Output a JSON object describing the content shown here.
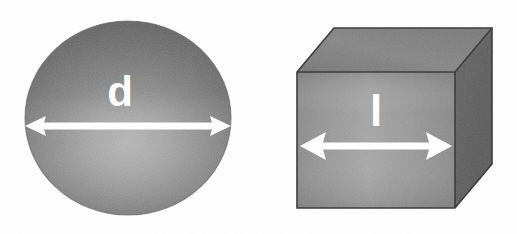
{
  "figure": {
    "background_color": "#ffffff",
    "width": 517,
    "height": 234,
    "texture": "film-grain-noise"
  },
  "sphere": {
    "shape_name": "sphere",
    "label": "d",
    "label_meaning": "diameter",
    "dimension_arrow": {
      "orientation": "horizontal",
      "heads": "double",
      "color": "#ffffff",
      "spans": "full-diameter"
    },
    "geometry": {
      "center_x": 128,
      "center_y": 118,
      "radius_x": 103,
      "radius_y": 97
    },
    "colors": {
      "edge": "#676767",
      "mid": "#888888",
      "highlight": "#aeaeae"
    }
  },
  "cube": {
    "shape_name": "cube",
    "label": "l",
    "label_meaning": "side length",
    "dimension_arrow": {
      "orientation": "horizontal",
      "heads": "double",
      "color": "#ffffff",
      "spans": "front-face-width"
    },
    "geometry": {
      "front_left": 297,
      "front_right": 455,
      "front_top": 72,
      "front_bottom": 208,
      "depth_dx": 37,
      "depth_dy": -44
    },
    "colors": {
      "front_face": "#8d8d8d",
      "front_face_highlight": "#a6a6a6",
      "top_face": "#808080",
      "right_face": "#5f5f5f",
      "outline": "#3a3a3a"
    }
  }
}
